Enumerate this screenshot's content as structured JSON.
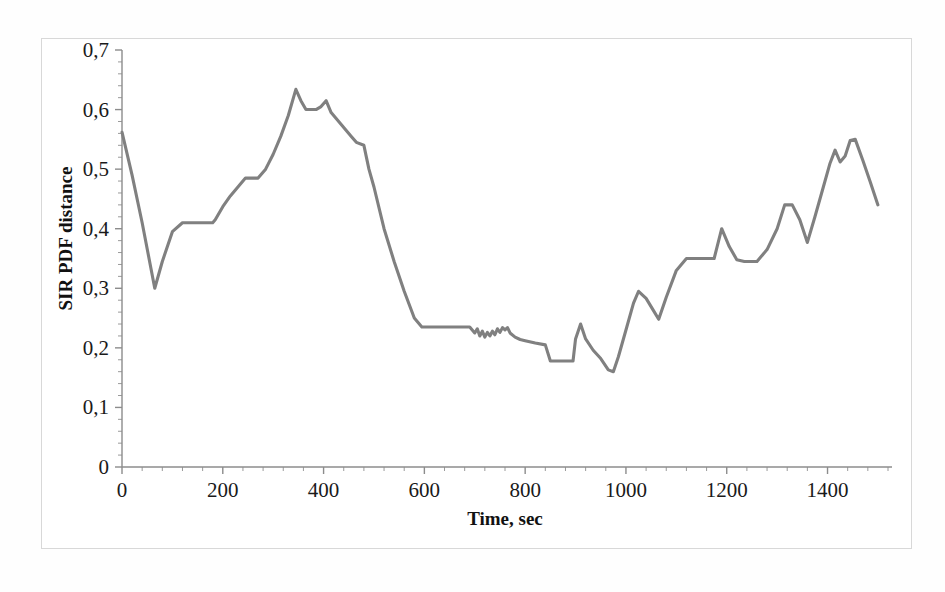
{
  "figure": {
    "background_color": "#ffffff",
    "frame_color": "#d8d8d8"
  },
  "chart_data": {
    "type": "line",
    "title": "",
    "xlabel": "Time, sec",
    "ylabel": "SIR PDF distance",
    "xlim": [
      0,
      1520
    ],
    "ylim": [
      0,
      0.7
    ],
    "grid": false,
    "legend": null,
    "decimal_separator": ",",
    "line_color": "#808080",
    "x_ticks": [
      0,
      200,
      400,
      600,
      800,
      1000,
      1200,
      1400
    ],
    "x_tick_labels": [
      "0",
      "200",
      "400",
      "600",
      "800",
      "1000",
      "1200",
      "1400"
    ],
    "x_minor_tick_step": 40,
    "y_ticks": [
      0,
      0.1,
      0.2,
      0.3,
      0.4,
      0.5,
      0.6,
      0.7
    ],
    "y_tick_labels": [
      "0",
      "0,1",
      "0,2",
      "0,3",
      "0,4",
      "0,5",
      "0,6",
      "0,7"
    ],
    "y_minor_tick_step": 0.02,
    "series": [
      {
        "name": "SIR PDF distance",
        "color": "#808080",
        "x": [
          0,
          20,
          40,
          65,
          80,
          100,
          120,
          135,
          150,
          180,
          185,
          200,
          215,
          230,
          245,
          260,
          270,
          285,
          300,
          315,
          330,
          345,
          355,
          365,
          375,
          385,
          395,
          405,
          415,
          425,
          435,
          445,
          455,
          465,
          480,
          490,
          500,
          520,
          540,
          560,
          580,
          595,
          605,
          640,
          670,
          690,
          700,
          705,
          710,
          715,
          720,
          725,
          730,
          735,
          740,
          745,
          750,
          755,
          760,
          765,
          770,
          780,
          790,
          800,
          820,
          840,
          850,
          860,
          880,
          895,
          900,
          910,
          920,
          935,
          950,
          965,
          975,
          985,
          1000,
          1015,
          1025,
          1040,
          1055,
          1065,
          1080,
          1100,
          1120,
          1150,
          1175,
          1190,
          1205,
          1220,
          1235,
          1260,
          1280,
          1300,
          1315,
          1330,
          1345,
          1360,
          1375,
          1390,
          1405,
          1415,
          1425,
          1435,
          1445,
          1455,
          1470,
          1485,
          1500
        ],
        "y": [
          0.562,
          0.49,
          0.41,
          0.3,
          0.345,
          0.395,
          0.41,
          0.41,
          0.41,
          0.41,
          0.415,
          0.437,
          0.455,
          0.47,
          0.485,
          0.485,
          0.485,
          0.5,
          0.525,
          0.555,
          0.59,
          0.634,
          0.615,
          0.6,
          0.6,
          0.6,
          0.605,
          0.615,
          0.595,
          0.585,
          0.575,
          0.565,
          0.555,
          0.545,
          0.54,
          0.5,
          0.47,
          0.4,
          0.345,
          0.295,
          0.25,
          0.235,
          0.235,
          0.235,
          0.235,
          0.235,
          0.225,
          0.232,
          0.22,
          0.228,
          0.218,
          0.226,
          0.22,
          0.228,
          0.222,
          0.232,
          0.226,
          0.234,
          0.23,
          0.234,
          0.225,
          0.218,
          0.214,
          0.212,
          0.208,
          0.205,
          0.178,
          0.178,
          0.178,
          0.178,
          0.215,
          0.24,
          0.215,
          0.196,
          0.182,
          0.163,
          0.16,
          0.185,
          0.23,
          0.275,
          0.295,
          0.283,
          0.262,
          0.248,
          0.285,
          0.33,
          0.35,
          0.35,
          0.35,
          0.4,
          0.37,
          0.348,
          0.345,
          0.345,
          0.365,
          0.4,
          0.44,
          0.44,
          0.415,
          0.377,
          0.42,
          0.465,
          0.51,
          0.532,
          0.512,
          0.522,
          0.548,
          0.55,
          0.515,
          0.478,
          0.44
        ]
      }
    ]
  }
}
